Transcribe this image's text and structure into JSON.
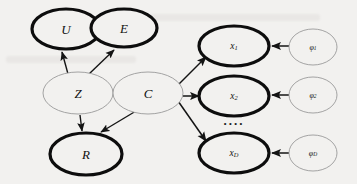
{
  "figure": {
    "type": "probabilistic-graphical-model",
    "background_color": "#f2f1ef",
    "observed_stroke_color": "#0d0d0d",
    "latent_stroke_color": "#9a9a9a",
    "edge_color": "#1a1a1a",
    "ellipsis_label": "...."
  },
  "nodes": {
    "u": {
      "label": "U",
      "style": "observed",
      "cx": 66,
      "cy": 29,
      "rx": 34,
      "ry": 20
    },
    "e": {
      "label": "E",
      "style": "observed",
      "cx": 124,
      "cy": 28,
      "rx": 33,
      "ry": 19
    },
    "z": {
      "label": "Z",
      "style": "latent",
      "cx": 78,
      "cy": 93,
      "rx": 35,
      "ry": 21
    },
    "c": {
      "label": "C",
      "style": "latent",
      "cx": 148,
      "cy": 93,
      "rx": 35,
      "ry": 21
    },
    "r": {
      "label": "R",
      "style": "observed",
      "cx": 86,
      "cy": 154,
      "rx": 36,
      "ry": 21
    },
    "x1": {
      "label": "x",
      "sub": "1",
      "style": "observed",
      "cx": 234,
      "cy": 46,
      "rx": 35,
      "ry": 20
    },
    "x2": {
      "label": "x",
      "sub": "2",
      "style": "observed",
      "cx": 234,
      "cy": 96,
      "rx": 35,
      "ry": 20
    },
    "xd": {
      "label": "x",
      "sub": "D",
      "style": "observed",
      "cx": 234,
      "cy": 153,
      "rx": 35,
      "ry": 20
    },
    "phi1": {
      "label": "φ",
      "sub": "1",
      "style": "latent",
      "cx": 313,
      "cy": 47,
      "rx": 24,
      "ry": 18
    },
    "phi2": {
      "label": "φ",
      "sub": "2",
      "style": "latent",
      "cx": 313,
      "cy": 95,
      "rx": 24,
      "ry": 18
    },
    "phid": {
      "label": "φ",
      "sub": "D",
      "style": "latent",
      "cx": 313,
      "cy": 153,
      "rx": 24,
      "ry": 18
    }
  },
  "edges": [
    {
      "name": "z-to-u",
      "from": "Z",
      "to": "U",
      "x1": 68,
      "y1": 74,
      "x2": 62,
      "y2": 51
    },
    {
      "name": "z-to-e",
      "from": "Z",
      "to": "E",
      "x1": 89,
      "y1": 74,
      "x2": 115,
      "y2": 49
    },
    {
      "name": "z-to-r",
      "from": "Z",
      "to": "R",
      "x1": 80,
      "y1": 115,
      "x2": 82,
      "y2": 132
    },
    {
      "name": "c-to-r",
      "from": "C",
      "to": "R",
      "x1": 134,
      "y1": 112,
      "x2": 100,
      "y2": 133
    },
    {
      "name": "c-to-x1",
      "from": "C",
      "to": "x1",
      "x1": 175,
      "y1": 88,
      "x2": 205,
      "y2": 57
    },
    {
      "name": "c-to-x2",
      "from": "C",
      "to": "x2",
      "x1": 183,
      "y1": 96,
      "x2": 198,
      "y2": 96
    },
    {
      "name": "c-to-xd",
      "from": "C",
      "to": "xD",
      "x1": 177,
      "y1": 101,
      "x2": 205,
      "y2": 142
    },
    {
      "name": "phi1-to-x1",
      "from": "φ₁",
      "to": "x1",
      "x1": 288,
      "y1": 46,
      "x2": 271,
      "y2": 46
    },
    {
      "name": "phi2-to-x2",
      "from": "φ₂",
      "to": "x2",
      "x1": 288,
      "y1": 95,
      "x2": 271,
      "y2": 95
    },
    {
      "name": "phid-to-xd",
      "from": "φ_D",
      "to": "xD",
      "x1": 288,
      "y1": 153,
      "x2": 271,
      "y2": 153
    }
  ],
  "ellipsis": {
    "text": "....",
    "cx": 234,
    "cy": 124
  }
}
